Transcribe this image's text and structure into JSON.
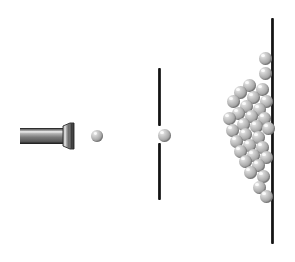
{
  "diagram": {
    "type": "physics-schematic",
    "canvas": {
      "width": 295,
      "height": 262,
      "background": "#ffffff"
    },
    "colors": {
      "line": "#1c1c1c",
      "sphere_light": "#f2f2f2",
      "sphere_mid": "#c0c0c0",
      "sphere_dark": "#7c7c7c",
      "gun_light": "#e8e8e8",
      "gun_mid": "#9a9a9a",
      "gun_dark": "#3d3d3d",
      "background": "#ffffff"
    },
    "labels": {
      "source": "bullet-gun",
      "emitted_particle": "bullet-in-flight",
      "barrier": "slit-barrier",
      "slit_particle": "bullet-passing-slit",
      "screen": "detector-screen",
      "pile": "bullet-impact-distribution"
    }
  },
  "gun": {
    "name": "bullet-gun",
    "barrel": {
      "x": 20,
      "y": 128,
      "width": 45,
      "height": 16
    },
    "muzzle": {
      "x": 63,
      "y": 123,
      "width": 11,
      "height": 26
    }
  },
  "barrier": {
    "name": "slit-barrier",
    "x": 158,
    "width": 3,
    "segments": [
      {
        "y": 68,
        "height": 58
      },
      {
        "y": 143,
        "height": 57
      }
    ],
    "slit": {
      "y": 126,
      "height": 17
    }
  },
  "screen": {
    "name": "detector-screen",
    "x": 271,
    "y": 18,
    "width": 3,
    "height": 226
  },
  "chart_data": {
    "type": "scatter",
    "xlabel": "",
    "ylabel": "",
    "free_particles": [
      {
        "name": "bullet-in-flight",
        "cx": 97,
        "cy": 136,
        "r": 6
      },
      {
        "name": "bullet-passing-slit",
        "cx": 164,
        "cy": 135,
        "r": 6.5
      }
    ],
    "pile": {
      "description": "Bullets accumulated against the detector screen, forming a broad single-peaked distribution centred on the slit axis.",
      "radius": 6.5,
      "points": [
        {
          "cx": 265,
          "cy": 58
        },
        {
          "cx": 265,
          "cy": 73
        },
        {
          "cx": 249,
          "cy": 85
        },
        {
          "cx": 262,
          "cy": 89
        },
        {
          "cx": 240,
          "cy": 92
        },
        {
          "cx": 253,
          "cy": 97
        },
        {
          "cx": 266,
          "cy": 101
        },
        {
          "cx": 233,
          "cy": 101
        },
        {
          "cx": 246,
          "cy": 106
        },
        {
          "cx": 259,
          "cy": 109
        },
        {
          "cx": 238,
          "cy": 113
        },
        {
          "cx": 251,
          "cy": 116
        },
        {
          "cx": 264,
          "cy": 118
        },
        {
          "cx": 229,
          "cy": 118
        },
        {
          "cx": 243,
          "cy": 124
        },
        {
          "cx": 256,
          "cy": 126
        },
        {
          "cx": 268,
          "cy": 128
        },
        {
          "cx": 232,
          "cy": 130
        },
        {
          "cx": 245,
          "cy": 134
        },
        {
          "cx": 258,
          "cy": 137
        },
        {
          "cx": 236,
          "cy": 141
        },
        {
          "cx": 249,
          "cy": 145
        },
        {
          "cx": 262,
          "cy": 147
        },
        {
          "cx": 240,
          "cy": 151
        },
        {
          "cx": 253,
          "cy": 155
        },
        {
          "cx": 266,
          "cy": 157
        },
        {
          "cx": 245,
          "cy": 161
        },
        {
          "cx": 258,
          "cy": 165
        },
        {
          "cx": 250,
          "cy": 172
        },
        {
          "cx": 263,
          "cy": 176
        },
        {
          "cx": 259,
          "cy": 187
        },
        {
          "cx": 266,
          "cy": 196
        }
      ]
    }
  }
}
